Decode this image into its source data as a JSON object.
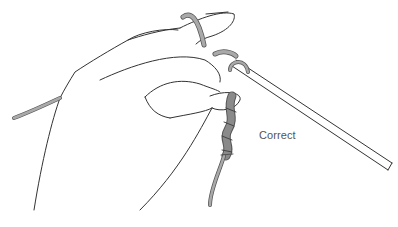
{
  "illustration": {
    "subject": "hand holding crochet hook with chain stitches",
    "label": "Correct",
    "colors": {
      "line": "#333333",
      "yarn": "#a9a9a9",
      "yarn_dark": "#8a8a8a",
      "label": "#555555",
      "background": "#ffffff"
    }
  }
}
